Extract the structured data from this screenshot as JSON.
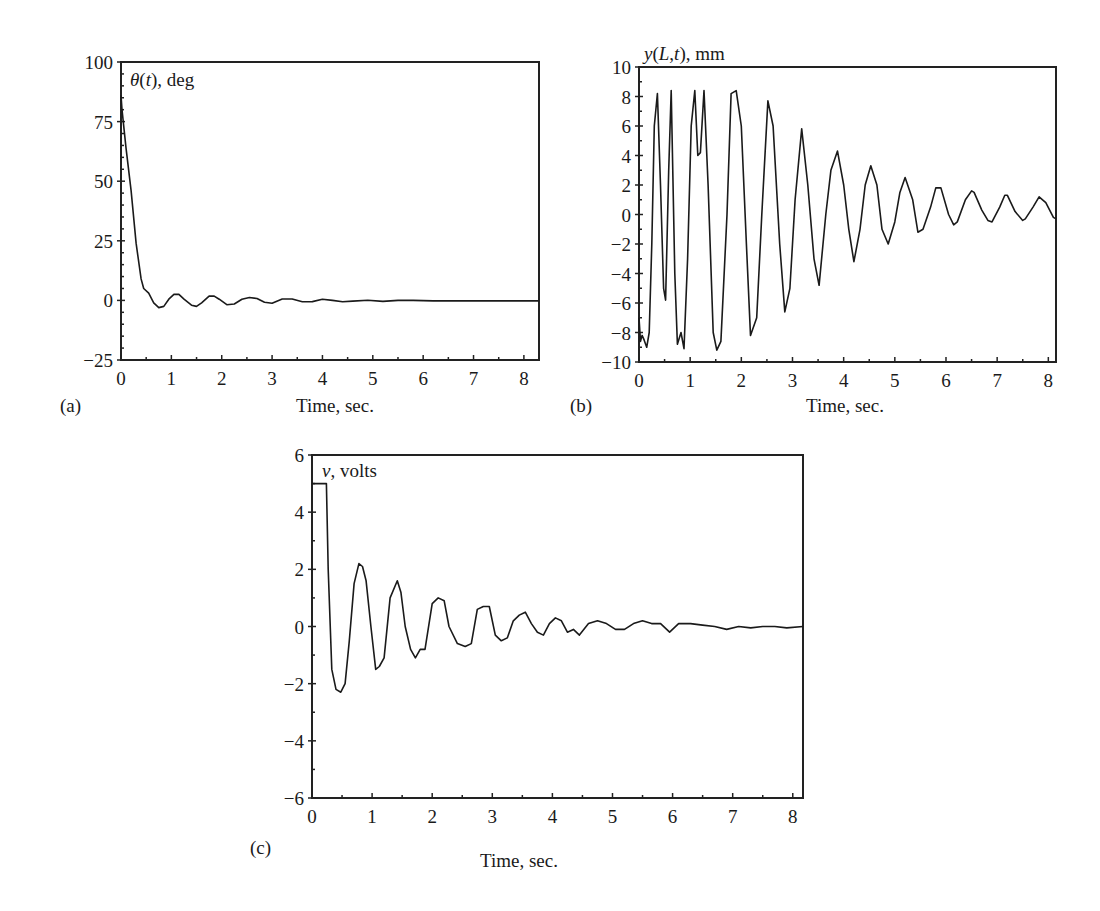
{
  "figure": {
    "panels": [
      {
        "id": "a",
        "label": "(a)",
        "xlabel": "Time, sec.",
        "series_label": "θ(t), deg"
      },
      {
        "id": "b",
        "label": "(b)",
        "xlabel": "Time, sec.",
        "series_label": "y(L,t), mm"
      },
      {
        "id": "c",
        "label": "(c)",
        "xlabel": "Time, sec.",
        "series_label": "v, volts"
      }
    ]
  },
  "chart_data": [
    {
      "panel": "(a)",
      "type": "line",
      "title": "",
      "series_label": "θ(t), deg",
      "xlabel": "Time, sec.",
      "ylabel": "θ(t), deg",
      "xlim": [
        0,
        8.3
      ],
      "ylim": [
        -25,
        100
      ],
      "xticks": [
        0,
        1,
        2,
        3,
        4,
        5,
        6,
        7,
        8
      ],
      "yticks": [
        -25,
        0,
        25,
        50,
        75,
        100
      ],
      "grid": false,
      "series": [
        {
          "name": "θ(t)",
          "x": [
            0,
            0.02,
            0.1,
            0.2,
            0.3,
            0.4,
            0.45,
            0.55,
            0.65,
            0.75,
            0.85,
            0.95,
            1.05,
            1.15,
            1.25,
            1.4,
            1.5,
            1.6,
            1.75,
            1.85,
            1.95,
            2.1,
            2.25,
            2.4,
            2.55,
            2.7,
            2.85,
            3.0,
            3.2,
            3.4,
            3.6,
            3.8,
            4.0,
            4.2,
            4.4,
            4.6,
            4.9,
            5.2,
            5.5,
            5.8,
            6.2,
            7.0,
            8.3
          ],
          "y": [
            86,
            80,
            64,
            46,
            24,
            9,
            5,
            3,
            -1,
            -3,
            -2.5,
            0.5,
            2.5,
            2.5,
            0.5,
            -2,
            -2.5,
            -1,
            1.8,
            1.8,
            0.5,
            -1.8,
            -1.5,
            0.5,
            1.2,
            0.8,
            -0.8,
            -1.2,
            0.6,
            0.6,
            -0.6,
            -0.5,
            0.5,
            0,
            -0.6,
            -0.3,
            0.1,
            -0.4,
            0,
            0,
            -0.2,
            -0.2,
            -0.2
          ]
        }
      ]
    },
    {
      "panel": "(b)",
      "type": "line",
      "title": "",
      "series_label": "y(L,t), mm",
      "xlabel": "Time, sec.",
      "ylabel": "y(L,t), mm",
      "xlim": [
        0,
        8.15
      ],
      "ylim": [
        -10,
        10
      ],
      "xticks": [
        0,
        1,
        2,
        3,
        4,
        5,
        6,
        7,
        8
      ],
      "yticks": [
        -10,
        -8,
        -6,
        -4,
        -2,
        0,
        2,
        4,
        6,
        8,
        10
      ],
      "grid": false,
      "series": [
        {
          "name": "y(L,t)",
          "x": [
            0,
            0.03,
            0.06,
            0.1,
            0.15,
            0.2,
            0.25,
            0.3,
            0.36,
            0.42,
            0.48,
            0.52,
            0.58,
            0.63,
            0.7,
            0.75,
            0.82,
            0.88,
            0.95,
            1.02,
            1.09,
            1.15,
            1.2,
            1.27,
            1.35,
            1.45,
            1.52,
            1.6,
            1.72,
            1.8,
            1.9,
            2.0,
            2.1,
            2.18,
            2.3,
            2.4,
            2.52,
            2.62,
            2.75,
            2.85,
            2.95,
            3.05,
            3.18,
            3.3,
            3.42,
            3.52,
            3.65,
            3.75,
            3.88,
            4.0,
            4.1,
            4.2,
            4.32,
            4.42,
            4.53,
            4.65,
            4.75,
            4.87,
            5.0,
            5.1,
            5.2,
            5.35,
            5.45,
            5.55,
            5.7,
            5.8,
            5.9,
            6.05,
            6.15,
            6.22,
            6.38,
            6.5,
            6.55,
            6.7,
            6.82,
            6.9,
            7.05,
            7.15,
            7.2,
            7.35,
            7.5,
            7.55,
            7.7,
            7.82,
            7.95,
            8.1,
            8.15
          ],
          "y": [
            -7,
            -8.6,
            -8.2,
            -8.5,
            -9,
            -8,
            -2,
            6,
            8.2,
            2,
            -5,
            -5.8,
            3,
            8.4,
            -4,
            -8.8,
            -8,
            -9.1,
            -3,
            6,
            8.4,
            4,
            4.2,
            8.4,
            2,
            -8,
            -9.2,
            -8.6,
            0,
            8.2,
            8.4,
            6,
            -2,
            -8.2,
            -7,
            0,
            7.7,
            6,
            -2,
            -6.6,
            -5,
            1,
            5.8,
            2,
            -3,
            -4.8,
            0,
            3,
            4.3,
            2,
            -1,
            -3.2,
            -1,
            2,
            3.3,
            2,
            -1,
            -2,
            -0.5,
            1.5,
            2.5,
            1,
            -1.2,
            -1,
            0.5,
            1.8,
            1.8,
            0,
            -0.7,
            -0.5,
            1,
            1.6,
            1.5,
            0.3,
            -0.4,
            -0.5,
            0.5,
            1.3,
            1.3,
            0.2,
            -0.4,
            -0.3,
            0.5,
            1.2,
            0.8,
            -0.2,
            -0.3
          ]
        }
      ]
    },
    {
      "panel": "(c)",
      "type": "line",
      "title": "",
      "series_label": "v, volts",
      "xlabel": "Time, sec.",
      "ylabel": "v, volts",
      "xlim": [
        0,
        8.17
      ],
      "ylim": [
        -6,
        6
      ],
      "xticks": [
        0,
        1,
        2,
        3,
        4,
        5,
        6,
        7,
        8
      ],
      "yticks": [
        -6,
        -4,
        -2,
        0,
        2,
        4,
        6
      ],
      "grid": false,
      "series": [
        {
          "name": "v",
          "x": [
            0,
            0.24,
            0.27,
            0.33,
            0.4,
            0.48,
            0.55,
            0.62,
            0.7,
            0.78,
            0.84,
            0.9,
            0.98,
            1.06,
            1.12,
            1.2,
            1.3,
            1.42,
            1.48,
            1.55,
            1.64,
            1.72,
            1.8,
            1.88,
            2.0,
            2.1,
            2.2,
            2.28,
            2.42,
            2.55,
            2.65,
            2.75,
            2.85,
            2.95,
            3.05,
            3.15,
            3.25,
            3.35,
            3.45,
            3.55,
            3.65,
            3.75,
            3.85,
            3.95,
            4.05,
            4.15,
            4.25,
            4.35,
            4.45,
            4.6,
            4.75,
            4.9,
            5.05,
            5.2,
            5.35,
            5.5,
            5.65,
            5.8,
            5.95,
            6.1,
            6.3,
            6.5,
            6.7,
            6.9,
            7.1,
            7.3,
            7.5,
            7.7,
            7.9,
            8.17
          ],
          "y": [
            5,
            5,
            2,
            -1.5,
            -2.2,
            -2.3,
            -2.0,
            -0.5,
            1.5,
            2.2,
            2.1,
            1.6,
            0,
            -1.5,
            -1.4,
            -1.1,
            1.0,
            1.6,
            1.2,
            0,
            -0.8,
            -1.1,
            -0.8,
            -0.8,
            0.8,
            1.0,
            0.9,
            0,
            -0.6,
            -0.7,
            -0.6,
            0.6,
            0.7,
            0.7,
            -0.3,
            -0.5,
            -0.4,
            0.2,
            0.4,
            0.5,
            0.1,
            -0.2,
            -0.3,
            0.1,
            0.3,
            0.2,
            -0.2,
            -0.1,
            -0.3,
            0.1,
            0.2,
            0.1,
            -0.1,
            -0.1,
            0.1,
            0.2,
            0.1,
            0.1,
            -0.2,
            0.1,
            0.1,
            0.05,
            0,
            -0.1,
            0,
            -0.05,
            0,
            0,
            -0.05,
            0
          ]
        }
      ]
    }
  ]
}
